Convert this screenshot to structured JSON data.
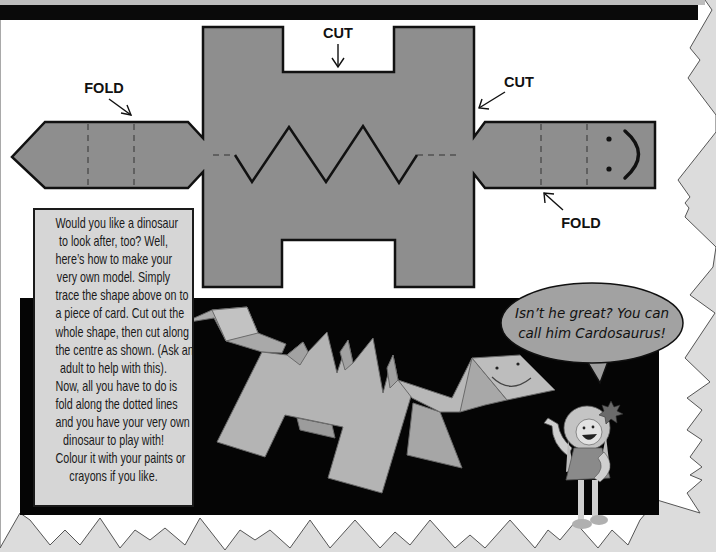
{
  "page": {
    "background_color": "#dcdcdc",
    "paper_color": "#ffffff",
    "card_color": "#8e8e8e",
    "dino_color": "#b4b4b4",
    "panel_color": "#050505",
    "textbox_color": "#d6d6d6"
  },
  "template": {
    "labels": {
      "cut_top": "CUT",
      "cut_right": "CUT",
      "fold_left": "FOLD",
      "fold_bottom": "FOLD"
    },
    "icons": {
      "arrows": [
        "arrow-down-icon",
        "arrow-down-left-icon",
        "arrow-down-right-icon",
        "arrow-up-left-icon"
      ],
      "face": "smiley-face-icon"
    }
  },
  "instructions": {
    "lines": [
      "Would you like a dinosaur",
      "to look after, too? Well,",
      "here’s how to make your",
      "very own model. Simply",
      "trace the shape above on to",
      "a piece of card. Cut out the",
      "whole shape, then cut along",
      "the centre as shown. (Ask an",
      "adult to help with this).",
      "Now, all you have to do is",
      "fold along the dotted lines",
      "and you have your very own",
      "dinosaur to play with!",
      "Colour it with your paints or",
      "crayons if you like."
    ]
  },
  "speech_bubble": {
    "lines": [
      "Isn’t he great? You can",
      "call him Cardosaurus!"
    ]
  }
}
